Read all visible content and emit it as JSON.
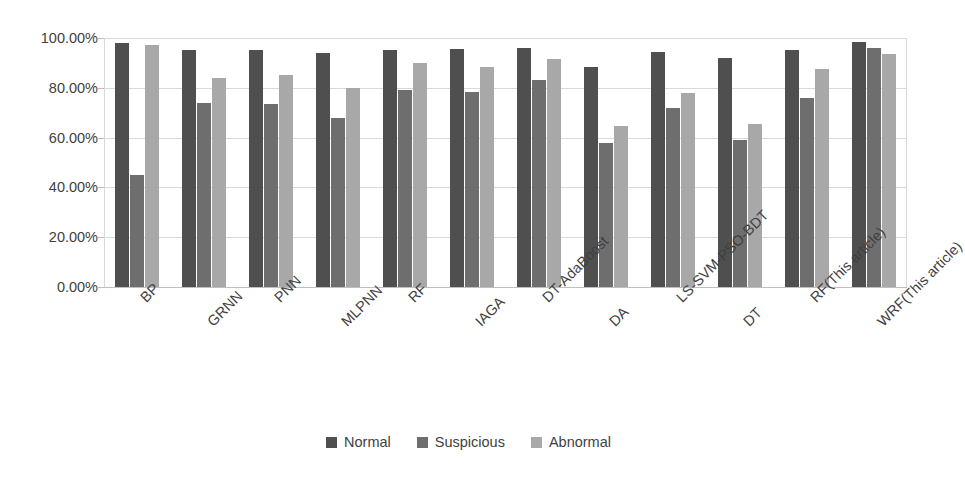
{
  "chart_data": {
    "type": "bar",
    "title": "",
    "subtitle": "",
    "xlabel": "",
    "ylabel": "",
    "ylim": [
      0,
      100
    ],
    "grid": true,
    "legend_position": "bottom",
    "categories": [
      "BP",
      "GRNN",
      "PNN",
      "MLPNN",
      "RF",
      "IAGA",
      "DT-AdaBoost",
      "DA",
      "LS-SVM-PSO-BDT",
      "DT",
      "RF(This article)",
      "WRF(This article)"
    ],
    "ytick_labels": [
      "100.00%",
      "80.00%",
      "60.00%",
      "40.00%",
      "20.00%",
      "0.00%"
    ],
    "ytick_values": [
      100,
      80,
      60,
      40,
      20,
      0
    ],
    "series": [
      {
        "name": "Normal",
        "color": "#4f4f4f",
        "values": [
          98.0,
          95.0,
          95.0,
          94.0,
          95.0,
          95.5,
          96.0,
          88.5,
          94.5,
          92.0,
          95.0,
          98.5
        ]
      },
      {
        "name": "Suspicious",
        "color": "#6e6e6e",
        "values": [
          45.0,
          74.0,
          73.5,
          68.0,
          79.0,
          78.5,
          83.0,
          58.0,
          72.0,
          59.0,
          76.0,
          96.0
        ]
      },
      {
        "name": "Abnormal",
        "color": "#a8a8a8",
        "values": [
          97.0,
          84.0,
          85.0,
          80.0,
          90.0,
          88.5,
          91.5,
          64.5,
          78.0,
          65.5,
          87.5,
          93.5
        ]
      }
    ]
  },
  "colors": {
    "normal": "#4f4f4f",
    "suspicious": "#6e6e6e",
    "abnormal": "#a8a8a8",
    "gridline": "#d9d9d9",
    "axis": "#bfbfbf",
    "text": "#3f3f3f",
    "background": "#ffffff"
  }
}
